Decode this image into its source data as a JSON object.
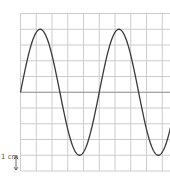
{
  "chart_data": {
    "type": "line",
    "title": "",
    "grid": true,
    "grid_columns": 10,
    "grid_rows": 10,
    "series": [
      {
        "name": "wave",
        "function": "sine",
        "amplitude_cm": 4,
        "wavelength_cm": 5,
        "phase": 0,
        "x_start_cm": 0,
        "x_end_cm": 10
      }
    ],
    "xlim": [
      0,
      10
    ],
    "ylim": [
      -5,
      5
    ],
    "scale_label": "1 cm",
    "colors": {
      "wave": "#3a3a3a",
      "grid": "#cccccc",
      "axis": "#999999"
    }
  }
}
